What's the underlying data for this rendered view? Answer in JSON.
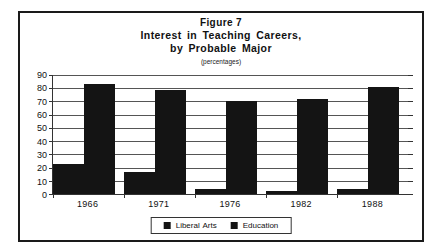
{
  "figure": {
    "number_label": "Figure 7",
    "title_line_1": "Interest in Teaching Careers,",
    "title_line_2": "by Probable Major",
    "subtitle": "(percentages)"
  },
  "legend": {
    "entries": [
      {
        "label": "Liberal Arts",
        "color": "#141414",
        "swatch_name": "legend-swatch-liberal-arts"
      },
      {
        "label": "Education",
        "color": "#141414",
        "swatch_name": "legend-swatch-education"
      }
    ]
  },
  "colors": {
    "bar_fill": "#141414",
    "frame_border": "#1a1a1a",
    "gridline": "#555555",
    "axis": "#333333",
    "background": "#ffffff"
  },
  "chart_data": {
    "type": "bar",
    "subtitle": "(percentages)",
    "categories": [
      "1966",
      "1971",
      "1976",
      "1982",
      "1988"
    ],
    "series": [
      {
        "name": "Liberal Arts",
        "values": [
          23,
          17,
          4,
          2,
          4
        ]
      },
      {
        "name": "Education",
        "values": [
          83,
          79,
          70,
          72,
          81
        ]
      }
    ],
    "xlabel": "",
    "ylabel": "",
    "ylim": [
      0,
      90
    ],
    "yticks": [
      0,
      10,
      20,
      30,
      40,
      50,
      60,
      70,
      80,
      90
    ],
    "ytick_labels": [
      "0",
      "10",
      "20",
      "30",
      "40",
      "50",
      "60",
      "70",
      "80",
      "90"
    ],
    "grid": true,
    "legend_position": "bottom-center"
  }
}
